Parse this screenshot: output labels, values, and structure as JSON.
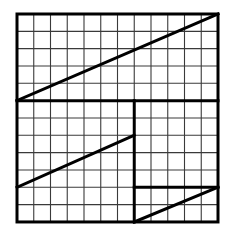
{
  "diagram": {
    "title": "Square grid partitioned into regions",
    "grid": {
      "columns": 12,
      "rows": 12,
      "origin_px": [
        17,
        14
      ],
      "cell_w_px": 16.75,
      "cell_h_px": 17.33,
      "grid_color": "#3a3a3a",
      "grid_width": 1.1,
      "border_color": "#000000",
      "border_width": 3
    },
    "segments": [
      {
        "name": "horizontal-divider-mid",
        "from": [
          0,
          5
        ],
        "to": [
          12,
          5
        ],
        "width": 3
      },
      {
        "name": "diagonal-top",
        "from": [
          0,
          5
        ],
        "to": [
          12,
          0
        ],
        "width": 3
      },
      {
        "name": "vertical-divider",
        "from": [
          7,
          5
        ],
        "to": [
          7,
          12
        ],
        "width": 3
      },
      {
        "name": "diagonal-lower-left",
        "from": [
          0,
          10
        ],
        "to": [
          7,
          7
        ],
        "width": 3
      },
      {
        "name": "horizontal-divider-lower-right",
        "from": [
          7,
          10
        ],
        "to": [
          12,
          10
        ],
        "width": 3
      },
      {
        "name": "diagonal-lower-right",
        "from": [
          7,
          12
        ],
        "to": [
          12,
          10
        ],
        "width": 3
      }
    ]
  }
}
